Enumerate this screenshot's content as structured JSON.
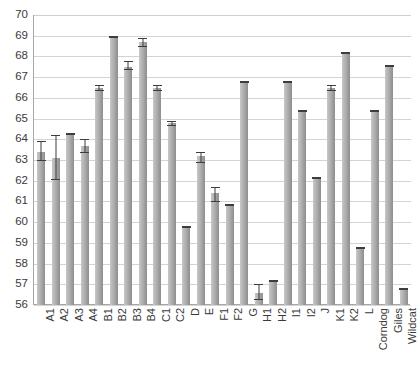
{
  "chart_data": {
    "type": "bar",
    "title": "",
    "xlabel": "",
    "ylabel": "",
    "ylim": [
      56,
      70
    ],
    "yticks": [
      56,
      57,
      58,
      59,
      60,
      61,
      62,
      63,
      64,
      65,
      66,
      67,
      68,
      69,
      70
    ],
    "grid": true,
    "legend": null,
    "error_bars": true,
    "categories": [
      "A1",
      "A2",
      "A3",
      "A4",
      "B1",
      "B2",
      "B3",
      "B4",
      "C1",
      "C2",
      "D",
      "E",
      "F1",
      "F2",
      "G",
      "H1",
      "H2",
      "I1",
      "I2",
      "J",
      "K1",
      "K2",
      "L",
      "Corndog",
      "Giles",
      "Wildcat"
    ],
    "values": [
      63.4,
      63.1,
      64.3,
      63.7,
      66.5,
      69.0,
      67.5,
      68.7,
      66.5,
      64.8,
      59.8,
      63.2,
      61.4,
      60.9,
      66.8,
      56.6,
      57.2,
      66.8,
      65.4,
      62.2,
      66.5,
      68.2,
      58.8,
      65.4,
      67.6,
      56.8
    ],
    "err_low": [
      63.0,
      62.1,
      64.3,
      63.4,
      66.4,
      69.0,
      67.4,
      68.5,
      66.4,
      64.7,
      59.8,
      62.9,
      61.0,
      60.9,
      66.8,
      56.3,
      57.2,
      66.8,
      65.4,
      62.2,
      66.4,
      68.2,
      58.8,
      65.4,
      67.6,
      56.8
    ],
    "err_high": [
      63.9,
      64.2,
      64.3,
      64.0,
      66.6,
      69.0,
      67.8,
      68.9,
      66.6,
      64.9,
      59.8,
      63.4,
      61.7,
      60.9,
      66.8,
      57.0,
      57.2,
      66.8,
      65.4,
      62.2,
      66.6,
      68.2,
      58.8,
      65.4,
      67.6,
      56.8
    ]
  },
  "colors": {
    "bar_light": "#c9c9c9",
    "bar_dark": "#8f8f8f",
    "grid": "#d4d4d4",
    "axis": "#a6a6a6",
    "text": "#3a3a3a",
    "error": "#3d3d3d",
    "background": "#ffffff"
  }
}
